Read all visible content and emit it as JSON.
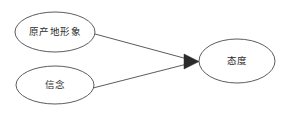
{
  "diagram": {
    "type": "path-model",
    "background_color": "#ffffff",
    "stroke_color": "#4a4a4a",
    "text_color": "#2b2b2b",
    "arrow_color": "#2b2b2b",
    "nodes": [
      {
        "id": "origin-image",
        "label": "原产地形象",
        "shape": "ellipse",
        "cx": 55,
        "cy": 32,
        "rx": 40,
        "ry": 20
      },
      {
        "id": "belief",
        "label": "信念",
        "shape": "ellipse",
        "cx": 55,
        "cy": 85,
        "rx": 39,
        "ry": 19
      },
      {
        "id": "attitude",
        "label": "态度",
        "shape": "ellipse",
        "cx": 237,
        "cy": 61,
        "rx": 38,
        "ry": 22
      }
    ],
    "edges": [
      {
        "id": "origin-image-to-attitude",
        "from": "origin-image",
        "to": "attitude",
        "x1": 95,
        "y1": 34,
        "x2": 196,
        "y2": 61,
        "arrow": "single"
      },
      {
        "id": "belief-to-attitude",
        "from": "belief",
        "to": "attitude",
        "x1": 93,
        "y1": 88,
        "x2": 196,
        "y2": 61,
        "arrow": "single"
      }
    ],
    "arrow_marker": {
      "points": "184,54 199,61.5 184,69"
    }
  }
}
